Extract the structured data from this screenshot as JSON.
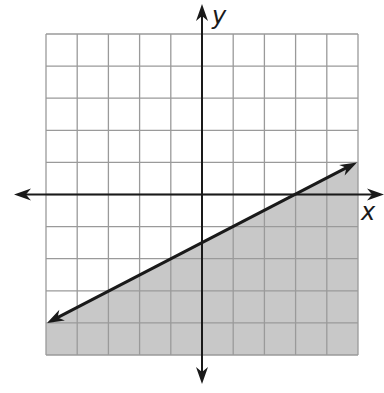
{
  "chart_data": {
    "type": "line",
    "title": "",
    "xlabel": "x",
    "ylabel": "y",
    "xlim": [
      -5,
      5
    ],
    "ylim": [
      -5,
      5
    ],
    "grid": true,
    "grid_step": 1,
    "tick_labels": false,
    "series": [
      {
        "name": "boundary line",
        "equation": "y = 0.5x - 1.5",
        "slope": 0.5,
        "intercept": -1.5,
        "style": "solid",
        "arrows": "both",
        "points": [
          [
            -5,
            -4
          ],
          [
            5,
            1
          ]
        ]
      }
    ],
    "shaded_region": {
      "description": "below the line",
      "inequality": "y <= 0.5x - 1.5"
    }
  },
  "labels": {
    "x_axis": "x",
    "y_axis": "y"
  },
  "colors": {
    "shading": "#c8c8c8",
    "grid": "#9a9a9a",
    "axis": "#1a1a1a",
    "line": "#1a1a1a"
  }
}
